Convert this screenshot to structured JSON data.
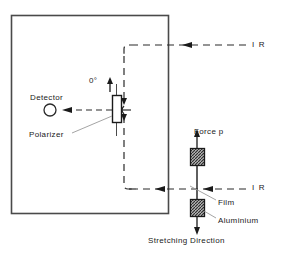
{
  "figure": {
    "colors": {
      "ink": "#1a1a1a",
      "frame": "#4a4a4a",
      "leader": "#8a8a8a",
      "background": "#ffffff",
      "clamp_fill": "#9a9a9a"
    }
  },
  "labels": {
    "detector": "Detector",
    "polarizer": "Polarizer",
    "angle_zero": "0°",
    "ir_top": "I R",
    "ir_bottom": "I R",
    "force": "Force  p",
    "film": "Film",
    "aluminium": "Aluminium",
    "stretching_direction": "Stretching Direction"
  },
  "geometry": {
    "enclosure": {
      "x": 11,
      "y": 15,
      "width": 157,
      "height": 198
    },
    "detector_circle": {
      "cx": 50,
      "cy": 110,
      "r": 6
    },
    "polarizer": {
      "x": 112,
      "y": 95,
      "width": 9,
      "height": 27
    },
    "sample_axis_x": 197,
    "clamp_upper": {
      "x": 190,
      "y": 148,
      "width": 14,
      "height": 17
    },
    "clamp_lower": {
      "x": 190,
      "y": 199,
      "width": 14,
      "height": 17
    },
    "beam_top_y": 45,
    "beam_bottom_y": 189,
    "beam_detector_y": 110,
    "beam_vertical_x": 131,
    "beam_right_x": 246
  }
}
